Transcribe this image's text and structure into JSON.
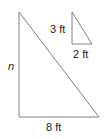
{
  "diagram": {
    "large_triangle": {
      "vertical_label": "n",
      "base_label": "8 ft"
    },
    "small_triangle": {
      "vertical_label": "3 ft",
      "base_label": "2 ft"
    },
    "stroke_color": "#808080"
  }
}
